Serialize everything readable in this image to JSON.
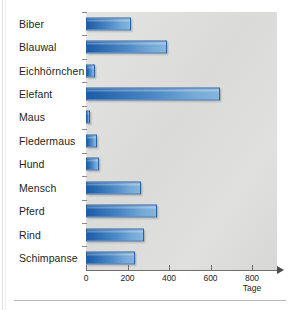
{
  "chart_data": {
    "type": "bar",
    "orientation": "horizontal",
    "title": "",
    "xlabel": "Tage",
    "ylabel": "",
    "categories": [
      "Biber",
      "Blauwal",
      "Eichhörnchen",
      "Elefant",
      "Maus",
      "Fledermaus",
      "Hund",
      "Mensch",
      "Pferd",
      "Rind",
      "Schimpanse"
    ],
    "values": [
      217,
      390,
      44,
      645,
      21,
      55,
      63,
      266,
      340,
      280,
      235
    ],
    "xlim": [
      0,
      800
    ],
    "xticks": [
      0,
      200,
      400,
      600,
      800
    ],
    "xtick_labels": [
      "0",
      "200",
      "400",
      "600",
      "800"
    ],
    "grid": false,
    "legend": false,
    "series": [
      {
        "name": "Tragzeit",
        "values": [
          217,
          390,
          44,
          645,
          21,
          55,
          63,
          266,
          340,
          280,
          235
        ]
      }
    ]
  },
  "axis": {
    "unit_label": "Tage",
    "ticks": [
      {
        "label": "0",
        "value": 0
      },
      {
        "label": "200",
        "value": 200
      },
      {
        "label": "400",
        "value": 400
      },
      {
        "label": "600",
        "value": 600
      },
      {
        "label": "800",
        "value": 800
      }
    ]
  },
  "colors": {
    "bar_dark": "#1b5ca6",
    "bar_light": "#86b6de",
    "bar_border": "#2b62a4",
    "plot_background": "#dcdcda",
    "page_background": "#ffffff",
    "text": "#231f20",
    "axis_line": "#6f6f6d",
    "rule": "#b9b9b7"
  }
}
